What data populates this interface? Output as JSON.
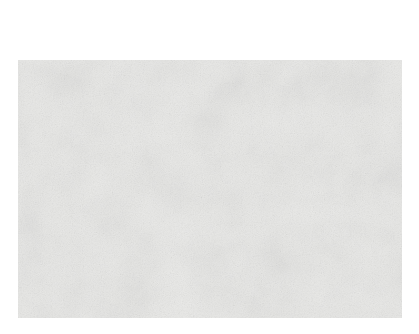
{
  "figure": {
    "kind": "histology-micrograph",
    "background_color": "#ffffff",
    "plate": {
      "x": 18,
      "y": 60,
      "width": 384,
      "height": 258,
      "base_color": "#e9e9e7",
      "stain_dark_color": "#4a4a4a",
      "stain_mid_color": "#8a8a88",
      "highlight_color": "#f6f6f4",
      "description": "Grayscale histologic section of spindle-cell connective tissue with elongated nuclei"
    }
  },
  "annotation": {
    "label": "Blood vessels",
    "label_color": "#1d1d1d",
    "leader_color": "#111111",
    "leader_width": 1.1,
    "anchor": {
      "x": 167,
      "y": 31
    },
    "targets": [
      {
        "name": "vessel-left",
        "x": 33,
        "y": 120
      },
      {
        "name": "vessel-lower-mid",
        "x": 140,
        "y": 198
      },
      {
        "name": "vessel-mid-right",
        "x": 198,
        "y": 143
      },
      {
        "name": "vessel-top-right",
        "x": 305,
        "y": 72
      }
    ]
  },
  "features": {
    "vessels": [
      {
        "name": "vessel-left",
        "cx": 28,
        "cy": 124,
        "rx": 11.5,
        "ry": 13.5,
        "rot": -12,
        "lumen": "#f3f3f1",
        "wall": "#5f5f5d",
        "filled": false
      },
      {
        "name": "vessel-top-right",
        "cx": 312,
        "cy": 72,
        "rx": 14,
        "ry": 10,
        "rot": -18,
        "lumen": "#efefed",
        "wall": "#4e4e4c",
        "filled": true
      },
      {
        "name": "vessel-lower-mid",
        "cx": 136,
        "cy": 203,
        "rx": 8.5,
        "ry": 5.5,
        "rot": -8,
        "lumen": "#f2f2f0",
        "wall": "#3f3f3d",
        "filled": false
      },
      {
        "name": "vessel-mid-right",
        "cx": 199,
        "cy": 146,
        "rx": 7,
        "ry": 4.5,
        "rot": 6,
        "lumen": "#f1f1ef",
        "wall": "#4a4a48",
        "filled": false
      },
      {
        "name": "vessel-bottom-left",
        "cx": 32,
        "cy": 291,
        "rx": 6.5,
        "ry": 4,
        "rot": -6,
        "lumen": "#f8f8f6",
        "wall": "#6a6a68",
        "filled": false
      },
      {
        "name": "vessel-top-mid",
        "cx": 224,
        "cy": 77,
        "rx": 6.5,
        "ry": 5.5,
        "rot": 0,
        "lumen": "#e3e3e1",
        "wall": "#3a3a38",
        "filled": true
      }
    ]
  },
  "texture": {
    "nuclei_count": 1500,
    "fiber_count": 420,
    "seed": 20250419,
    "note": "Procedurally regenerated spindle-nucleus stroma approximating the original stained section"
  }
}
